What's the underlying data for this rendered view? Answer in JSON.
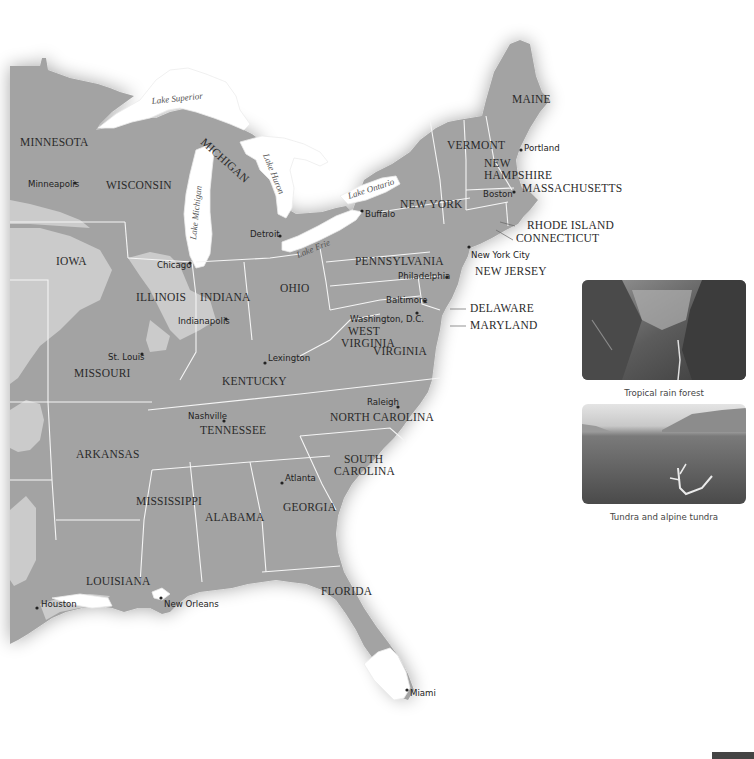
{
  "map": {
    "colors": {
      "land_dark": "#9c9c9c",
      "land_light": "#c8c8c8",
      "water": "#ffffff",
      "border": "#f4f4f4",
      "text": "#2a2a2a"
    },
    "states": [
      {
        "name": "MINNESOTA",
        "x": 20,
        "y": 146
      },
      {
        "name": "WISCONSIN",
        "x": 106,
        "y": 189
      },
      {
        "name": "MICHIGAN",
        "x": 200,
        "y": 143
      },
      {
        "name": "IOWA",
        "x": 56,
        "y": 265
      },
      {
        "name": "ILLINOIS",
        "x": 136,
        "y": 301
      },
      {
        "name": "INDIANA",
        "x": 200,
        "y": 301
      },
      {
        "name": "OHIO",
        "x": 280,
        "y": 292
      },
      {
        "name": "PENNSYLVANIA",
        "x": 355,
        "y": 265
      },
      {
        "name": "NEW YORK",
        "x": 400,
        "y": 208
      },
      {
        "name": "VERMONT",
        "x": 447,
        "y": 149
      },
      {
        "name": "NEW HAMPSHIRE",
        "x": 484,
        "y": 167
      },
      {
        "name": "MAINE",
        "x": 512,
        "y": 103
      },
      {
        "name": "MASSACHUSETTS",
        "x": 522,
        "y": 192
      },
      {
        "name": "RHODE ISLAND",
        "x": 527,
        "y": 228
      },
      {
        "name": "CONNECTICUT",
        "x": 516,
        "y": 241
      },
      {
        "name": "NEW JERSEY",
        "x": 475,
        "y": 275
      },
      {
        "name": "DELAWARE",
        "x": 470,
        "y": 312
      },
      {
        "name": "MARYLAND",
        "x": 470,
        "y": 329
      },
      {
        "name": "WEST VIRGINIA",
        "x": 343,
        "y": 335
      },
      {
        "name": "VIRGINIA",
        "x": 373,
        "y": 355
      },
      {
        "name": "KENTUCKY",
        "x": 222,
        "y": 385
      },
      {
        "name": "MISSOURI",
        "x": 74,
        "y": 377
      },
      {
        "name": "TENNESSEE",
        "x": 200,
        "y": 434
      },
      {
        "name": "NORTH CAROLINA",
        "x": 330,
        "y": 421
      },
      {
        "name": "ARKANSAS",
        "x": 76,
        "y": 458
      },
      {
        "name": "SOUTH CAROLINA",
        "x": 344,
        "y": 463
      },
      {
        "name": "MISSISSIPPI",
        "x": 136,
        "y": 505
      },
      {
        "name": "ALABAMA",
        "x": 205,
        "y": 521
      },
      {
        "name": "GEORGIA",
        "x": 283,
        "y": 511
      },
      {
        "name": "LOUISIANA",
        "x": 86,
        "y": 585
      },
      {
        "name": "FLORIDA",
        "x": 321,
        "y": 595
      }
    ],
    "cities": [
      {
        "name": "Minneapolis",
        "x": 75,
        "y": 183,
        "label_x": 28,
        "label_y": 187
      },
      {
        "name": "Detroit",
        "x": 280,
        "y": 236,
        "label_x": 250,
        "label_y": 237
      },
      {
        "name": "Buffalo",
        "x": 362,
        "y": 211,
        "label_x": 365,
        "label_y": 217
      },
      {
        "name": "Chicago",
        "x": 190,
        "y": 263,
        "label_x": 157,
        "label_y": 268
      },
      {
        "name": "Indianapolis",
        "x": 226,
        "y": 319,
        "label_x": 178,
        "label_y": 324
      },
      {
        "name": "St. Louis",
        "x": 142,
        "y": 354,
        "label_x": 108,
        "label_y": 360
      },
      {
        "name": "Lexington",
        "x": 265,
        "y": 363,
        "label_x": 268,
        "label_y": 361
      },
      {
        "name": "Nashville",
        "x": 224,
        "y": 421,
        "label_x": 188,
        "label_y": 419
      },
      {
        "name": "Atlanta",
        "x": 282,
        "y": 483,
        "label_x": 285,
        "label_y": 481
      },
      {
        "name": "Raleigh",
        "x": 398,
        "y": 407,
        "label_x": 367,
        "label_y": 405
      },
      {
        "name": "Portland",
        "x": 521,
        "y": 150,
        "label_x": 524,
        "label_y": 151
      },
      {
        "name": "Boston",
        "x": 514,
        "y": 192,
        "label_x": 483,
        "label_y": 197
      },
      {
        "name": "New York City",
        "x": 469,
        "y": 247,
        "label_x": 471,
        "label_y": 258
      },
      {
        "name": "Philadelphia",
        "x": 447,
        "y": 277,
        "label_x": 398,
        "label_y": 279
      },
      {
        "name": "Baltimore",
        "x": 425,
        "y": 301,
        "label_x": 386,
        "label_y": 303
      },
      {
        "name": "Washington, D.C.",
        "x": 417,
        "y": 313,
        "label_x": 350,
        "label_y": 322
      },
      {
        "name": "Houston",
        "x": 37,
        "y": 608,
        "label_x": 41,
        "label_y": 607
      },
      {
        "name": "New Orleans",
        "x": 161,
        "y": 598,
        "label_x": 164,
        "label_y": 607
      },
      {
        "name": "Miami",
        "x": 407,
        "y": 690,
        "label_x": 410,
        "label_y": 696
      }
    ],
    "lakes": [
      {
        "name": "Lake Superior",
        "x": 152,
        "y": 104,
        "rotate": -6
      },
      {
        "name": "Lake Michigan",
        "x": 196,
        "y": 240,
        "rotate": -84
      },
      {
        "name": "Lake Huron",
        "x": 263,
        "y": 158,
        "rotate": 68
      },
      {
        "name": "Lake Erie",
        "x": 296,
        "y": 253,
        "rotate": -22
      },
      {
        "name": "Lake Ontario",
        "x": 349,
        "y": 197,
        "rotate": -18
      }
    ]
  },
  "photos": [
    {
      "caption": "Tropical rain forest",
      "type": "rain-forest"
    },
    {
      "caption": "Tundra and alpine tundra",
      "type": "tundra"
    }
  ]
}
